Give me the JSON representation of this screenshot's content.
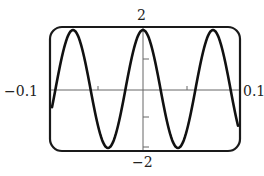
{
  "chart_data": {
    "type": "line",
    "title": "",
    "xlabel": "",
    "ylabel": "",
    "xlim": [
      -0.1,
      0.1
    ],
    "ylim": [
      -2,
      2
    ],
    "x_tick_labels": [
      "-0.1",
      "0.1"
    ],
    "y_tick_labels": [
      "2",
      "-2"
    ],
    "grid": false,
    "legend": null,
    "function_description": "y ≈ 2cos(2πx/0.074), approximately 2.7 periods across the window",
    "series": [
      {
        "name": "curve",
        "color": "#111111",
        "x": [
          -0.1,
          -0.0925,
          -0.085,
          -0.074,
          -0.063,
          -0.055,
          -0.037,
          -0.019,
          0.0,
          0.019,
          0.037,
          0.055,
          0.074,
          0.085,
          0.0925,
          0.1
        ],
        "y": [
          -0.6,
          0.9,
          1.8,
          2.0,
          1.0,
          0.0,
          -2.0,
          0.0,
          2.0,
          0.0,
          -2.0,
          0.0,
          2.0,
          1.8,
          0.9,
          -0.6
        ]
      }
    ]
  },
  "labels": {
    "ymax": "2",
    "ymin": "−2",
    "xmin": "−0.1",
    "xmax": "0.1"
  },
  "colors": {
    "curve": "#111111",
    "frame": "#1a1a1a",
    "axes": "#555555"
  }
}
